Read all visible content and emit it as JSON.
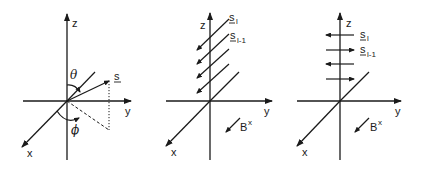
{
  "figure": {
    "panels": [
      {
        "id": "spin-angles",
        "axis_labels": {
          "z": "z",
          "y": "y",
          "x": "x"
        },
        "vector_label": "s",
        "angle_labels": {
          "polar": "θ",
          "azimuthal": "ϕ"
        }
      },
      {
        "id": "spins-along-x",
        "axis_labels": {
          "z": "z",
          "y": "y",
          "x": "x"
        },
        "spin_labels": {
          "top": "s",
          "top_sub": "l",
          "second": "s",
          "second_sub": "l-1"
        },
        "field_label": "B",
        "field_sup": "x"
      },
      {
        "id": "spins-along-y",
        "axis_labels": {
          "z": "z",
          "y": "y",
          "x": "x"
        },
        "spin_labels": {
          "top": "s",
          "top_sub": "l",
          "second": "s",
          "second_sub": "l-1"
        },
        "field_label": "B",
        "field_sup": "x"
      }
    ],
    "colors": {
      "ink": "#1a1a1a",
      "background": "#ffffff"
    }
  }
}
